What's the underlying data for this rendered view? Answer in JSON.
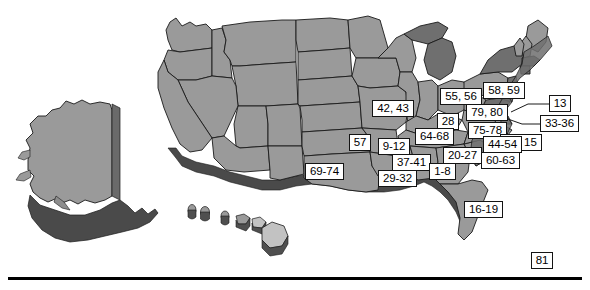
{
  "figure": {
    "type": "map",
    "region": "United States",
    "style": "3d-extruded-choropleth-grayscale",
    "baseline_rule": true
  },
  "colors": {
    "land_light": "#c9c9c9",
    "land_mid": "#9a9a9a",
    "land_dark": "#6f6f6f",
    "extrude_shadow": "#4a4a4a",
    "outline": "#1a1a1a",
    "label_bg": "#ffffff",
    "label_border": "#141414",
    "label_text": "#000000",
    "leader_line": "#1a1a1a",
    "baseline": "#000000"
  },
  "labels": [
    {
      "id": "lbl-42-43",
      "text": "42, 43",
      "x": 372,
      "y": 100,
      "w": 42,
      "h": 17
    },
    {
      "id": "lbl-55-56",
      "text": "55, 56",
      "x": 440,
      "y": 88,
      "w": 42,
      "h": 17
    },
    {
      "id": "lbl-58-59",
      "text": "58, 59",
      "x": 483,
      "y": 82,
      "w": 42,
      "h": 17
    },
    {
      "id": "lbl-13",
      "text": "13",
      "x": 549,
      "y": 95,
      "w": 22,
      "h": 17
    },
    {
      "id": "lbl-79-80",
      "text": "79, 80",
      "x": 466,
      "y": 104,
      "w": 42,
      "h": 17
    },
    {
      "id": "lbl-28",
      "text": "28",
      "x": 437,
      "y": 113,
      "w": 22,
      "h": 17
    },
    {
      "id": "lbl-33-36",
      "text": "33-36",
      "x": 540,
      "y": 115,
      "w": 39,
      "h": 17
    },
    {
      "id": "lbl-75-78",
      "text": "75-78",
      "x": 468,
      "y": 122,
      "w": 39,
      "h": 17
    },
    {
      "id": "lbl-64-68",
      "text": "64-68",
      "x": 415,
      "y": 128,
      "w": 39,
      "h": 17
    },
    {
      "id": "lbl-14-15",
      "text": "14, 15",
      "x": 500,
      "y": 134,
      "w": 42,
      "h": 17
    },
    {
      "id": "lbl-57",
      "text": "57",
      "x": 349,
      "y": 134,
      "w": 22,
      "h": 17
    },
    {
      "id": "lbl-9-12",
      "text": "9-12",
      "x": 378,
      "y": 138,
      "w": 32,
      "h": 17
    },
    {
      "id": "lbl-44-54",
      "text": "44-54",
      "x": 483,
      "y": 136,
      "w": 39,
      "h": 17
    },
    {
      "id": "lbl-20-27",
      "text": "20-27",
      "x": 443,
      "y": 147,
      "w": 39,
      "h": 17
    },
    {
      "id": "lbl-60-63",
      "text": "60-63",
      "x": 481,
      "y": 152,
      "w": 39,
      "h": 17
    },
    {
      "id": "lbl-37-41",
      "text": "37-41",
      "x": 392,
      "y": 154,
      "w": 39,
      "h": 17
    },
    {
      "id": "lbl-1-8",
      "text": "1-8",
      "x": 429,
      "y": 163,
      "w": 27,
      "h": 17
    },
    {
      "id": "lbl-69-74",
      "text": "69-74",
      "x": 305,
      "y": 163,
      "w": 39,
      "h": 17
    },
    {
      "id": "lbl-29-32",
      "text": "29-32",
      "x": 378,
      "y": 170,
      "w": 39,
      "h": 17
    },
    {
      "id": "lbl-16-19",
      "text": "16-19",
      "x": 464,
      "y": 201,
      "w": 39,
      "h": 17
    },
    {
      "id": "lbl-81",
      "text": "81",
      "x": 531,
      "y": 252,
      "w": 22,
      "h": 17
    }
  ],
  "leader_lines": [
    {
      "id": "leader-13",
      "points": "549,104 528,104 511,112"
    },
    {
      "id": "leader-33-36",
      "points": "540,124 522,124 505,118"
    },
    {
      "id": "leader-14-15",
      "points": "508,134 500,127 494,120"
    }
  ]
}
